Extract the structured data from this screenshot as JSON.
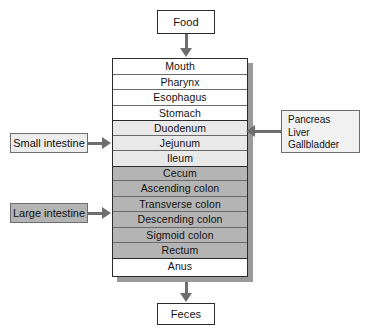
{
  "diagram": {
    "input": {
      "label": "Food"
    },
    "output": {
      "label": "Feces"
    },
    "tract": {
      "segments": [
        {
          "name": "upper-tract",
          "fill": "#ffffff",
          "rows": [
            {
              "label": "Mouth"
            },
            {
              "label": "Pharynx"
            },
            {
              "label": "Esophagus"
            },
            {
              "label": "Stomach"
            }
          ]
        },
        {
          "name": "small-intestine",
          "fill": "#e9e9e9",
          "rows": [
            {
              "label": "Duodenum"
            },
            {
              "label": "Jejunum"
            },
            {
              "label": "Ileum"
            }
          ]
        },
        {
          "name": "large-intestine",
          "fill": "#b4b4b4",
          "rows": [
            {
              "label": "Cecum"
            },
            {
              "label": "Ascending colon"
            },
            {
              "label": "Transverse colon"
            },
            {
              "label": "Descending colon"
            },
            {
              "label": "Sigmoid colon"
            },
            {
              "label": "Rectum"
            }
          ]
        },
        {
          "name": "anus",
          "fill": "#ffffff",
          "rows": [
            {
              "label": "Anus"
            }
          ]
        }
      ]
    },
    "side_labels": {
      "small_intestine": "Small intestine",
      "large_intestine": "Large intestine"
    },
    "accessory_organs": {
      "items": [
        "Pancreas",
        "Liver",
        "Gallbladder"
      ]
    },
    "colors": {
      "upper_fill": "#ffffff",
      "small_intestine_fill": "#e9e9e9",
      "large_intestine_fill": "#b4b4b4",
      "accessory_fill": "#f1f1f1",
      "outline": "#2b2b2b",
      "connector": "#6e6e6e",
      "shadow": "#9a9a9a"
    }
  }
}
